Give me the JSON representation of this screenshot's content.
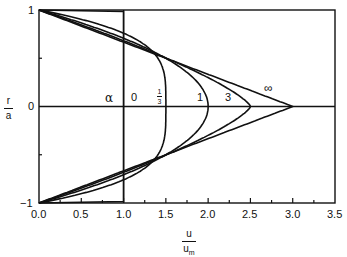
{
  "chart_data": {
    "type": "line",
    "title": "",
    "xlabel": "u / u_m",
    "ylabel": "r / a",
    "xlim": [
      0.0,
      3.5
    ],
    "ylim": [
      -1,
      1
    ],
    "x_ticks": [
      "0.0",
      "0.5",
      "1.0",
      "1.5",
      "2.0",
      "2.5",
      "3.0",
      "3.5"
    ],
    "y_ticks": [
      "-1",
      "0",
      "1"
    ],
    "grid": false,
    "reference_lines": [
      {
        "axis": "x",
        "value": 1.0
      },
      {
        "axis": "y",
        "value": 0
      }
    ],
    "legend_title": "α",
    "formula": "u/u_m = (3α+1)/(α+1) · (1 − |r/a|^((α+1)/α))",
    "series": [
      {
        "name": "0",
        "alpha": 0,
        "peak_u": 1.0,
        "label": "0"
      },
      {
        "name": "1/3",
        "alpha": 0.3333,
        "peak_u": 1.5,
        "label": "1/3"
      },
      {
        "name": "1",
        "alpha": 1,
        "peak_u": 2.0,
        "label": "1"
      },
      {
        "name": "3",
        "alpha": 3,
        "peak_u": 2.5,
        "label": "3"
      },
      {
        "name": "∞",
        "alpha": "inf",
        "peak_u": 3.0,
        "label": "∞"
      }
    ]
  },
  "labels": {
    "x_num": "u",
    "x_den": "u",
    "x_sub": "m",
    "y_num": "r",
    "y_den": "a",
    "alpha": "α",
    "c0": "0",
    "c13_num": "1",
    "c13_den": "3",
    "c1": "1",
    "c3": "3",
    "cinf": "∞",
    "yt1": "1",
    "yt0": "0",
    "ytm1": "−1",
    "xt0": "0.0",
    "xt1": "0.5",
    "xt2": "1.0",
    "xt3": "1.5",
    "xt4": "2.0",
    "xt5": "2.5",
    "xt6": "3.0",
    "xt7": "3.5"
  },
  "colors": {
    "ink": "#111111",
    "background": "#ffffff"
  }
}
